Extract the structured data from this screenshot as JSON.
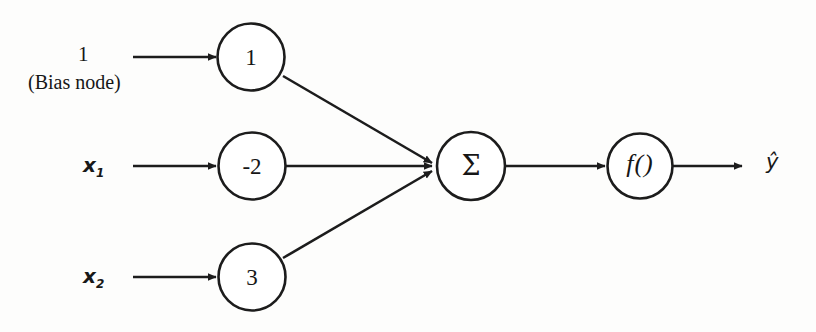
{
  "diagram": {
    "type": "neural-network-perceptron",
    "stroke_color": "#1c1c1c",
    "background_color": "#fdfdfc",
    "inputs": [
      {
        "id": "bias",
        "value": "1",
        "caption": "(Bias node)",
        "weight": "1"
      },
      {
        "id": "x1",
        "value": "x",
        "subscript": "1",
        "weight": "-2"
      },
      {
        "id": "x2",
        "value": "x",
        "subscript": "2",
        "weight": "3"
      }
    ],
    "nodes": {
      "bias_weight": "1",
      "x1_weight": "-2",
      "x2_weight": "3",
      "summation": "Σ",
      "activation": "f()"
    },
    "output": {
      "label": "ŷ"
    }
  }
}
